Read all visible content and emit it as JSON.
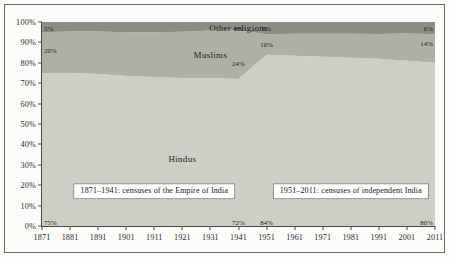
{
  "chart_data": {
    "type": "area",
    "stacked": true,
    "title": "",
    "subtitle": "",
    "xlabel": "",
    "ylabel": "",
    "x": [
      1871,
      1881,
      1891,
      1901,
      1911,
      1921,
      1931,
      1941,
      1951,
      1961,
      1971,
      1981,
      1991,
      2001,
      2011
    ],
    "xtick_labels": [
      "1871",
      "1881",
      "1891",
      "1901",
      "1911",
      "1921",
      "1931",
      "1941",
      "1951",
      "1961",
      "1971",
      "1981",
      "1991",
      "2001",
      "2011"
    ],
    "ytick_labels": [
      "0%",
      "10%",
      "20%",
      "30%",
      "40%",
      "50%",
      "60%",
      "70%",
      "80%",
      "90%",
      "100%"
    ],
    "ytick_values": [
      0,
      10,
      20,
      30,
      40,
      50,
      60,
      70,
      80,
      90,
      100
    ],
    "ylim": [
      0,
      100
    ],
    "xlim": [
      1871,
      2011
    ],
    "grid": false,
    "legend": "inline-labels",
    "series": [
      {
        "name": "Hindus",
        "label": "Hindus",
        "color": "#cfcec6",
        "values": [
          75,
          75,
          74.5,
          73.5,
          73,
          72.5,
          72.5,
          72,
          84,
          83.5,
          83,
          82.5,
          82,
          81,
          80
        ]
      },
      {
        "name": "Muslims",
        "label": "Muslims",
        "color": "#b0afa6",
        "values": [
          20,
          20.3,
          20.8,
          21.5,
          22,
          22.7,
          23.3,
          24,
          10,
          10.7,
          11.2,
          11.7,
          12.1,
          13.4,
          14
        ]
      },
      {
        "name": "Other religions",
        "label": "Other religions",
        "color": "#8d8d84",
        "values": [
          5,
          4.7,
          4.7,
          5,
          5,
          4.8,
          4.2,
          4,
          6,
          5.8,
          5.8,
          5.8,
          5.9,
          5.6,
          6
        ]
      }
    ],
    "annotations": [
      {
        "text": "75%",
        "x": 1871,
        "y": 2,
        "series": "Hindus",
        "align": "left"
      },
      {
        "text": "72%",
        "x": 1941,
        "y": 2,
        "series": "Hindus",
        "align": "center"
      },
      {
        "text": "84%",
        "x": 1951,
        "y": 2,
        "series": "Hindus",
        "align": "center"
      },
      {
        "text": "80%",
        "x": 2011,
        "y": 2,
        "series": "Hindus",
        "align": "right"
      },
      {
        "text": "20%",
        "x": 1871,
        "y": 86.5,
        "series": "Muslims",
        "align": "left"
      },
      {
        "text": "24%",
        "x": 1941,
        "y": 80,
        "series": "Muslims",
        "align": "center"
      },
      {
        "text": "10%",
        "x": 1951,
        "y": 89,
        "series": "Muslims",
        "align": "center"
      },
      {
        "text": "14%",
        "x": 2011,
        "y": 89.5,
        "series": "Muslims",
        "align": "right"
      },
      {
        "text": "5%",
        "x": 1871,
        "y": 97,
        "series": "Other religions",
        "align": "left"
      },
      {
        "text": "4%",
        "x": 1941,
        "y": 97,
        "series": "Other religions",
        "align": "center"
      },
      {
        "text": "6%",
        "x": 1951,
        "y": 97,
        "series": "Other religions",
        "align": "center"
      },
      {
        "text": "6%",
        "x": 2011,
        "y": 97,
        "series": "Other religions",
        "align": "right"
      }
    ],
    "series_labels": [
      {
        "text": "Other religions",
        "x": 1941,
        "y": 97.2
      },
      {
        "text": "Muslims",
        "x": 1931,
        "y": 84
      },
      {
        "text": "Hindus",
        "x": 1921,
        "y": 33
      }
    ],
    "captions": [
      {
        "text": "1871–1941: censuses of the Empire of India",
        "x": 1911,
        "y": 17
      },
      {
        "text": "1951–2011: censuses of independent India",
        "x": 1981,
        "y": 17
      }
    ]
  }
}
